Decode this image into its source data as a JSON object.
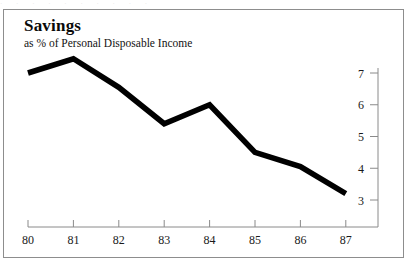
{
  "figure": {
    "scan_artifact_text": "·  ·   ·    ·     ·      ·       ·        ·         ·          ·",
    "frame_color": "#8d8d8d",
    "background_color": "#ffffff"
  },
  "chart_data": {
    "type": "line",
    "title": "Savings",
    "subtitle": "as % of Personal Disposable Income",
    "xlabel": "",
    "ylabel": "",
    "categories": [
      "80",
      "81",
      "82",
      "83",
      "84",
      "85",
      "86",
      "87"
    ],
    "values": [
      7.0,
      7.45,
      6.55,
      5.4,
      6.0,
      4.5,
      4.05,
      3.2
    ],
    "series": [
      {
        "name": "Savings as % of Personal Disposable Income",
        "values": [
          7.0,
          7.45,
          6.55,
          5.4,
          6.0,
          4.5,
          4.05,
          3.2
        ],
        "color": "#000000",
        "line_width": 5.6
      }
    ],
    "x_tick_labels": [
      "80",
      "81",
      "82",
      "83",
      "84",
      "85",
      "86",
      "87"
    ],
    "y_tick_labels": [
      "7",
      "6",
      "5",
      "4",
      "3"
    ],
    "y_tick_values": [
      7,
      6,
      5,
      4,
      3
    ],
    "ylim": [
      2.6,
      7.6
    ],
    "xlim": [
      79.6,
      87.9
    ],
    "y_axis_position": "right",
    "x_axis_position": "bottom",
    "grid": false,
    "legend": false,
    "legend_position": "none"
  }
}
